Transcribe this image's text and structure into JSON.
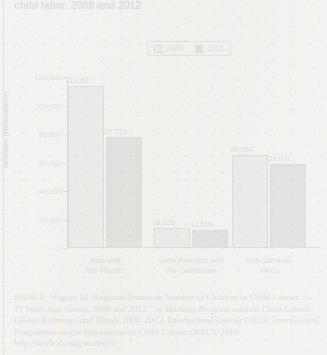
{
  "title": "child labor, 2008 and 2012",
  "legend": {
    "position": "top-center",
    "items": [
      {
        "label": "2008",
        "color": "#b4b4b4"
      },
      {
        "label": "2012",
        "color": "#4d4d4d"
      }
    ]
  },
  "chart_data": {
    "type": "bar",
    "title": "child labor, 2008 and 2012",
    "xlabel": "",
    "ylabel": "Number (thousands)",
    "ylim": [
      0,
      120000
    ],
    "ytick_labels": [
      "120,000",
      "100,000",
      "80,000",
      "60,000",
      "40,000",
      "20,000",
      "0"
    ],
    "ytick_values": [
      120000,
      100000,
      80000,
      60000,
      40000,
      20000,
      0
    ],
    "grid": false,
    "legend_position": "top-center",
    "categories": [
      "Asia and\nthe Pacific",
      "Latin America and\nthe Caribbean",
      "Sub-Saharan\nAfrica"
    ],
    "category_lines": [
      [
        "Asia and",
        "the Pacific"
      ],
      [
        "Latin America and",
        "the Caribbean"
      ],
      [
        "Sub-Saharan",
        "Africa"
      ]
    ],
    "series": [
      {
        "name": "2008",
        "color": "#b4b4b4",
        "values": [
          113607,
          14125,
          65064
        ],
        "data_labels": [
          "113,607",
          "14,125",
          "65,064"
        ]
      },
      {
        "name": "2012",
        "color": "#4d4d4d",
        "values": [
          77723,
          12505,
          59031
        ],
        "data_labels": [
          "77,723",
          "12,505",
          "59,031"
        ]
      }
    ]
  },
  "source": {
    "prefix": "SOURCE",
    "line1": ": “Figure 12. Regional Trends in Number of Children in Child",
    "line2a": "Labour, 5–17 Years Age Group, 2008 and 2012,” in ",
    "line2b": "Marking Progress",
    "line3": "against Child Labour: Global Estimates and Trends 2000–2012",
    "line3b": ",",
    "line4": "International Labour Office, International Programme on the",
    "line5": "Elimination of Child Labour (IPEC), 2013, http://www.ilo.org/wcmsp5/"
  }
}
